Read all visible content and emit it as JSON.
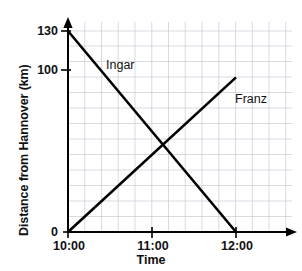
{
  "chart_data": {
    "type": "line",
    "title": "",
    "subtitle": "",
    "xlabel": "Time",
    "ylabel": "Distance from Hannover (km)",
    "x_tick_labels": [
      "10:00",
      "11:00",
      "12:00"
    ],
    "x_tick_values": [
      10,
      11,
      12
    ],
    "y_tick_labels": [
      "0",
      "100",
      "130"
    ],
    "y_tick_values": [
      0,
      100,
      130
    ],
    "xlim": [
      10,
      12.2
    ],
    "ylim": [
      0,
      130
    ],
    "grid": true,
    "grid_x_step_hours": 0.1667,
    "grid_y_step_km": 10,
    "legend": "inline-labels",
    "legend_position": "on-lines",
    "annotations": [
      {
        "text": "Ingar",
        "x": 10.55,
        "y": 104
      },
      {
        "text": "Franz",
        "x": 11.78,
        "y": 82
      }
    ],
    "series": [
      {
        "name": "Ingar",
        "x": [
          10,
          12
        ],
        "values": [
          130,
          0
        ],
        "color": "#000000"
      },
      {
        "name": "Franz",
        "x": [
          10,
          12
        ],
        "values": [
          0,
          100
        ],
        "color": "#000000"
      }
    ],
    "intersection": {
      "x": 11.13,
      "y": 56.5
    }
  },
  "colors": {
    "line": "#000000",
    "axis": "#000000",
    "grid": "#c9ccd4",
    "background": "#ffffff",
    "text": "#111111"
  },
  "axes": {
    "x_axis_label": "Time",
    "y_axis_label": "Distance from Hannover (km)"
  },
  "ticks": {
    "y": {
      "t130": "130",
      "t100": "100",
      "t0": "0"
    },
    "x": {
      "t1000": "10:00",
      "t1100": "11:00",
      "t1200": "12:00"
    }
  },
  "series_labels": {
    "ingar": "Ingar",
    "franz": "Franz"
  }
}
